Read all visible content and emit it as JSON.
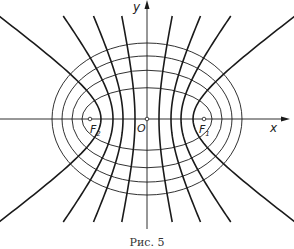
{
  "figure": {
    "caption": "Рис. 5",
    "labels": {
      "x_axis": "x",
      "y_axis": "y",
      "origin": "O",
      "focus_left": "F",
      "focus_left_sub": "2",
      "focus_right": "F",
      "focus_right_sub": "1"
    },
    "colors": {
      "stroke": "#1a1a1a",
      "background": "#ffffff"
    },
    "geometry": {
      "center": [
        147,
        119
      ],
      "focal_distance_c": 57,
      "ellipse_semi_major_a": [
        95,
        85,
        75,
        65
      ],
      "hyperbola_vertex_a": [
        12,
        24,
        34,
        46
      ],
      "hyperbola_y_extent": 103,
      "x_axis": {
        "from": 0,
        "to": 290
      },
      "y_axis": {
        "from": 229,
        "to": 0
      }
    }
  }
}
